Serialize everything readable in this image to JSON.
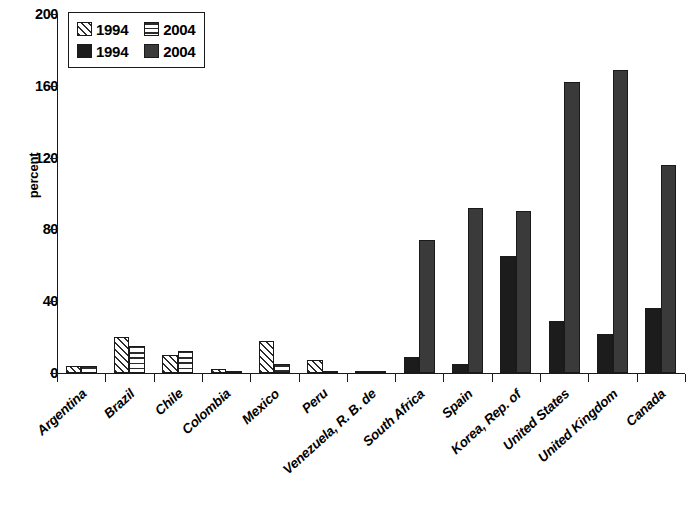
{
  "chart_data": {
    "type": "bar",
    "title": "",
    "subtitle": "",
    "xlabel": "",
    "ylabel": "percent",
    "ylim": [
      0,
      200
    ],
    "yticks": [
      0,
      40,
      80,
      120,
      160,
      200
    ],
    "grid": false,
    "legend_position": "top-left",
    "categories": [
      "Argentina",
      "Brazil",
      "Chile",
      "Colombia",
      "Mexico",
      "Peru",
      "Venezuela, R. B. de",
      "South Africa",
      "Spain",
      "Korea, Rep. of",
      "United States",
      "United Kingdom",
      "Canada"
    ],
    "series": [
      {
        "name": "1994",
        "style": "hatch-diagonal",
        "group": "light",
        "values": [
          4,
          20,
          10,
          2,
          18,
          7,
          1,
          null,
          null,
          null,
          null,
          null,
          null
        ]
      },
      {
        "name": "2004",
        "style": "hatch-horizontal",
        "group": "light",
        "values": [
          4,
          15,
          12,
          1,
          5,
          1,
          1,
          null,
          null,
          null,
          null,
          null,
          null
        ]
      },
      {
        "name": "1994",
        "style": "solid-black",
        "group": "dark",
        "values": [
          null,
          null,
          null,
          null,
          null,
          null,
          null,
          9,
          5,
          65,
          29,
          22,
          36
        ]
      },
      {
        "name": "2004",
        "style": "solid-darkgray",
        "group": "dark",
        "values": [
          null,
          null,
          null,
          null,
          null,
          null,
          null,
          74,
          92,
          90,
          162,
          169,
          116
        ]
      }
    ]
  },
  "legend": {
    "rows": [
      [
        {
          "label": "1994",
          "swatch": "hatch-diagonal-swatch"
        },
        {
          "label": "2004",
          "swatch": "hatch-horizontal-swatch"
        }
      ],
      [
        {
          "label": "1994",
          "swatch": "solid-black-swatch"
        },
        {
          "label": "2004",
          "swatch": "solid-darkgray-swatch"
        }
      ]
    ]
  },
  "colors": {
    "axis": "#1a1a1a",
    "series_1994_dark": "#1c1c1c",
    "series_2004_dark": "#3a3a3a",
    "hatch": "#2b2b2b",
    "background": "#ffffff"
  }
}
